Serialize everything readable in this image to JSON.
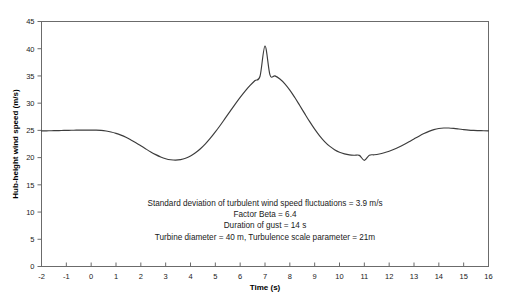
{
  "chart_data": {
    "type": "line",
    "title": "",
    "xlabel": "Time (s)",
    "ylabel": "Hub-height wind speed (m/s)",
    "xlim": [
      -2,
      16
    ],
    "ylim": [
      0,
      45
    ],
    "xticks": [
      -2,
      -1,
      0,
      1,
      2,
      3,
      4,
      5,
      6,
      7,
      8,
      9,
      10,
      11,
      12,
      13,
      14,
      15,
      16
    ],
    "yticks": [
      0,
      5,
      10,
      15,
      20,
      25,
      30,
      35,
      40,
      45
    ],
    "xtick_labels": [
      "-2",
      "-1",
      "0",
      "1",
      "2",
      "3",
      "4",
      "5",
      "6",
      "7",
      "8",
      "9",
      "10",
      "11",
      "12",
      "13",
      "14",
      "15",
      "16"
    ],
    "ytick_labels": [
      "0",
      "5",
      "10",
      "15",
      "20",
      "25",
      "30",
      "35",
      "40",
      "45"
    ],
    "grid": false,
    "legend": false,
    "series": [
      {
        "name": "Hub-height wind speed",
        "color": "#3c3c3c",
        "x": [
          -2.0,
          -1.8,
          -1.6,
          -1.4,
          -1.2,
          -1.0,
          -0.8,
          -0.6,
          -0.4,
          -0.2,
          0.0,
          0.2,
          0.4,
          0.6,
          0.8,
          1.0,
          1.2,
          1.4,
          1.6,
          1.8,
          2.0,
          2.2,
          2.4,
          2.6,
          2.8,
          3.0,
          3.2,
          3.4,
          3.6,
          3.8,
          4.0,
          4.2,
          4.4,
          4.6,
          4.8,
          5.0,
          5.2,
          5.4,
          5.6,
          5.8,
          6.0,
          6.2,
          6.4,
          6.6,
          6.8,
          7.0,
          7.2,
          7.4,
          7.6,
          7.8,
          8.0,
          8.2,
          8.4,
          8.6,
          8.8,
          9.0,
          9.2,
          9.4,
          9.6,
          9.8,
          10.0,
          10.2,
          10.4,
          10.6,
          10.8,
          11.0,
          11.2,
          11.4,
          11.6,
          11.8,
          12.0,
          12.2,
          12.4,
          12.6,
          12.8,
          13.0,
          13.2,
          13.4,
          13.6,
          13.8,
          14.0,
          14.2,
          14.4,
          14.6,
          14.8,
          15.0,
          15.2,
          15.4,
          15.6,
          15.8,
          16.0
        ],
        "y": [
          24.9,
          24.92,
          24.94,
          24.96,
          24.98,
          25.0,
          25.02,
          25.04,
          25.05,
          25.06,
          25.06,
          25.04,
          24.99,
          24.88,
          24.71,
          24.46,
          24.13,
          23.73,
          23.25,
          22.73,
          22.17,
          21.6,
          21.05,
          20.55,
          20.12,
          19.8,
          19.6,
          19.53,
          19.62,
          19.87,
          20.29,
          20.88,
          21.63,
          22.53,
          23.57,
          24.72,
          25.95,
          27.24,
          28.54,
          29.83,
          31.06,
          32.21,
          33.25,
          34.17,
          34.95,
          40.5,
          35.19,
          35.01,
          34.45,
          33.56,
          32.4,
          31.04,
          29.57,
          28.07,
          26.6,
          25.23,
          24.0,
          22.95,
          22.1,
          21.45,
          20.98,
          20.68,
          20.5,
          20.43,
          20.41,
          19.5,
          20.44,
          20.52,
          20.66,
          20.88,
          21.17,
          21.53,
          21.95,
          22.42,
          22.92,
          23.44,
          23.94,
          24.41,
          24.82,
          25.14,
          25.35,
          25.44,
          25.43,
          25.36,
          25.26,
          25.15,
          25.06,
          25.0,
          24.96,
          24.93,
          24.92
        ]
      }
    ],
    "annotations": [
      "Standard deviation of turbulent wind speed fluctuations = 3.9 m/s",
      "Factor Beta = 6.4",
      "Duration of gust = 14 s",
      "Turbine diameter = 40 m, Turbulence scale parameter = 21m"
    ],
    "peak_value": 40.5,
    "peak_time": 7,
    "baseline_value": 25,
    "trough_value": 19.5
  }
}
